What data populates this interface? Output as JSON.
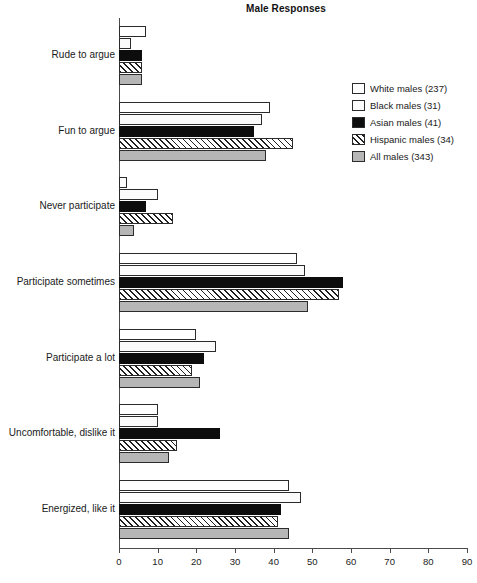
{
  "chart_data": {
    "type": "bar",
    "orientation": "horizontal",
    "title": "Male Responses",
    "xlabel": "",
    "ylabel": "",
    "xlim": [
      0,
      90
    ],
    "xticks": [
      0,
      10,
      20,
      30,
      40,
      50,
      60,
      70,
      80,
      90
    ],
    "grid": false,
    "legend_position": "right",
    "categories": [
      "Rude to argue",
      "Fun to argue",
      "Never participate",
      "Participate sometimes",
      "Participate a lot",
      "Uncomfortable, dislike it",
      "Energized, like it"
    ],
    "series": [
      {
        "name": "White males (237)",
        "pattern": "open",
        "color": "#ffffff",
        "values": [
          7,
          39,
          2,
          46,
          20,
          10,
          44
        ]
      },
      {
        "name": "Black males (31)",
        "pattern": "dotted",
        "color": "#fbfbfb",
        "values": [
          3,
          37,
          10,
          48,
          25,
          10,
          47
        ]
      },
      {
        "name": "Asian males (41)",
        "pattern": "solid-black",
        "color": "#0d0d0d",
        "values": [
          6,
          35,
          7,
          58,
          22,
          26,
          42
        ]
      },
      {
        "name": "Hispanic males (34)",
        "pattern": "diagonal-hatch",
        "color": "#ffffff",
        "values": [
          6,
          45,
          14,
          57,
          19,
          15,
          41
        ]
      },
      {
        "name": "All males (343)",
        "pattern": "gray",
        "color": "#b6b6b6",
        "values": [
          6,
          38,
          4,
          49,
          21,
          13,
          44
        ]
      }
    ]
  }
}
